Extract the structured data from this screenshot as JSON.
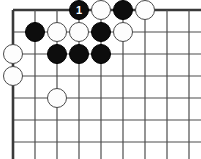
{
  "figure": {
    "kind": "go-board-diagram",
    "width": 201,
    "height": 159,
    "background_color": "#ffffff"
  },
  "board": {
    "columns": 9,
    "rows": 7,
    "origin_x": 13,
    "origin_y": 10,
    "spacing": 22,
    "line_color": "#4d4d4d",
    "line_width": 1.2,
    "edge_line_color": "#3a3a3a",
    "edge_line_width": 2.6,
    "left_edge_is_board_border": true,
    "top_edge_is_board_border": true,
    "right_edge_is_board_border": false,
    "bottom_edge_is_board_border": false
  },
  "stones": {
    "black_color": "#0d0d0d",
    "white_color": "#fdfdfd",
    "white_outline_color": "#4a4a4a",
    "diameter": 20,
    "list": [
      {
        "color": "black",
        "col": 4,
        "row": 1,
        "label": "1",
        "marked": true
      },
      {
        "color": "white",
        "col": 5,
        "row": 1,
        "label": "",
        "marked": false
      },
      {
        "color": "black",
        "col": 6,
        "row": 1,
        "label": "",
        "marked": false
      },
      {
        "color": "white",
        "col": 7,
        "row": 1,
        "label": "",
        "marked": false
      },
      {
        "color": "black",
        "col": 2,
        "row": 2,
        "label": "",
        "marked": false
      },
      {
        "color": "white",
        "col": 3,
        "row": 2,
        "label": "",
        "marked": false
      },
      {
        "color": "white",
        "col": 4,
        "row": 2,
        "label": "",
        "marked": false
      },
      {
        "color": "black",
        "col": 5,
        "row": 2,
        "label": "",
        "marked": false
      },
      {
        "color": "white",
        "col": 6,
        "row": 2,
        "label": "",
        "marked": false
      },
      {
        "color": "white",
        "col": 1,
        "row": 3,
        "label": "",
        "marked": false
      },
      {
        "color": "black",
        "col": 3,
        "row": 3,
        "label": "",
        "marked": false
      },
      {
        "color": "black",
        "col": 4,
        "row": 3,
        "label": "",
        "marked": false
      },
      {
        "color": "black",
        "col": 5,
        "row": 3,
        "label": "",
        "marked": false
      },
      {
        "color": "white",
        "col": 1,
        "row": 4,
        "label": "",
        "marked": false
      },
      {
        "color": "white",
        "col": 3,
        "row": 5,
        "label": "",
        "marked": false
      }
    ]
  },
  "move_marker": {
    "number": "1",
    "stone_color": "black",
    "text_color": "#ffffff"
  }
}
